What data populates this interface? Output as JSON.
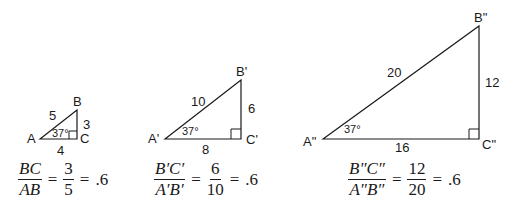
{
  "triangles": [
    {
      "id": "small",
      "vertices": {
        "A": "A",
        "B": "B",
        "C": "C"
      },
      "sides": {
        "hypotenuse": "5",
        "vertical": "3",
        "base": "4"
      },
      "angle": "37°",
      "ratio": {
        "num": "BC",
        "den": "AB",
        "value_num": "3",
        "value_den": "5",
        "result": ".6"
      }
    },
    {
      "id": "medium",
      "vertices": {
        "A": "A'",
        "B": "B'",
        "C": "C'"
      },
      "sides": {
        "hypotenuse": "10",
        "vertical": "6",
        "base": "8"
      },
      "angle": "37°",
      "ratio": {
        "num": "B′C′",
        "den": "A′B′",
        "value_num": "6",
        "value_den": "10",
        "result": ".6"
      }
    },
    {
      "id": "large",
      "vertices": {
        "A": "A\"",
        "B": "B\"",
        "C": "C\""
      },
      "sides": {
        "hypotenuse": "20",
        "vertical": "12",
        "base": "16"
      },
      "angle": "37°",
      "ratio": {
        "num": "B″C″",
        "den": "A″B″",
        "value_num": "12",
        "value_den": "20",
        "result": ".6"
      }
    }
  ],
  "symbols": {
    "equals": "="
  }
}
